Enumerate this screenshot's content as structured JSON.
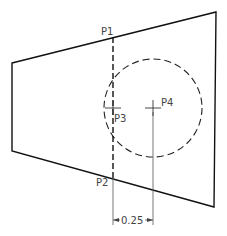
{
  "diagram": {
    "type": "technical-drawing",
    "colors": {
      "line": "#111111",
      "text": "#444444",
      "thin": "#555555",
      "background": "#ffffff"
    },
    "points": [
      {
        "id": "P1",
        "label": "P1"
      },
      {
        "id": "P2",
        "label": "P2"
      },
      {
        "id": "P3",
        "label": "P3"
      },
      {
        "id": "P4",
        "label": "P4"
      }
    ],
    "dimension": {
      "label": "0.25"
    },
    "shapes": {
      "quadrilateral": "trapezoid outline",
      "circle": "dashed circle centered at P4",
      "dashed_line": "vertical dashed line from P1 to P2 through P3"
    }
  }
}
